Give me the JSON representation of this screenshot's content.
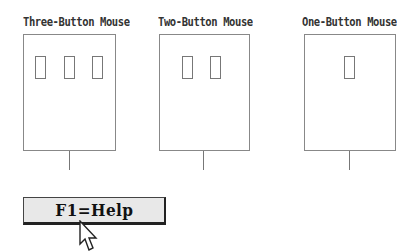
{
  "mice": [
    {
      "label": "Three-Button Mouse",
      "buttons": 3
    },
    {
      "label": "Two-Button Mouse",
      "buttons": 2
    },
    {
      "label": "One-Button Mouse",
      "buttons": 1
    }
  ],
  "help_button": {
    "label": "F1=Help"
  },
  "pointer": {
    "icon": "mouse-pointer-arrow-icon"
  }
}
